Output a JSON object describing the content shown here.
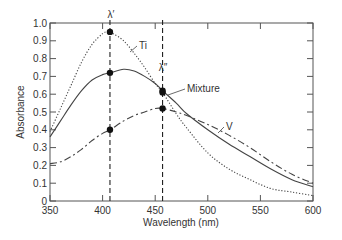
{
  "chart_data": {
    "type": "line",
    "title": "",
    "xlabel": "Wavelength (nm)",
    "ylabel": "Absorbance",
    "xlim": [
      350,
      600
    ],
    "ylim": [
      0,
      1.0
    ],
    "xticks": [
      350,
      400,
      450,
      500,
      550,
      600
    ],
    "xtick_labels": [
      "350",
      "400",
      "450",
      "500",
      "550",
      "600"
    ],
    "yticks": [
      0,
      0.1,
      0.2,
      0.3,
      0.4,
      0.5,
      0.6,
      0.7,
      0.8,
      0.9,
      1.0
    ],
    "ytick_labels": [
      "0",
      "0.1",
      "0.2",
      "0.3",
      "0.4",
      "0.5",
      "0.6",
      "0.7",
      "0.8",
      "0.9",
      "1.0"
    ],
    "grid": false,
    "legend": "inline labels",
    "series": [
      {
        "name": "Ti",
        "style": "dotted",
        "x": [
          350,
          360,
          370,
          380,
          390,
          400,
          405,
          410,
          420,
          430,
          440,
          450,
          457,
          470,
          480,
          500,
          520,
          540,
          560,
          580,
          600
        ],
        "values": [
          0.39,
          0.52,
          0.65,
          0.78,
          0.88,
          0.94,
          0.95,
          0.94,
          0.9,
          0.83,
          0.75,
          0.66,
          0.61,
          0.49,
          0.41,
          0.27,
          0.18,
          0.12,
          0.07,
          0.05,
          0.03
        ]
      },
      {
        "name": "Mixture",
        "style": "solid",
        "x": [
          350,
          360,
          370,
          380,
          390,
          400,
          407,
          420,
          430,
          440,
          450,
          457,
          470,
          480,
          500,
          520,
          540,
          560,
          580,
          600
        ],
        "values": [
          0.36,
          0.45,
          0.54,
          0.62,
          0.68,
          0.71,
          0.72,
          0.74,
          0.73,
          0.7,
          0.66,
          0.62,
          0.55,
          0.49,
          0.4,
          0.32,
          0.25,
          0.18,
          0.12,
          0.08
        ]
      },
      {
        "name": "V",
        "style": "dash-dot",
        "x": [
          350,
          360,
          370,
          380,
          390,
          400,
          407,
          420,
          430,
          440,
          450,
          457,
          470,
          480,
          500,
          520,
          540,
          560,
          580,
          600
        ],
        "values": [
          0.21,
          0.22,
          0.25,
          0.29,
          0.34,
          0.38,
          0.4,
          0.45,
          0.48,
          0.5,
          0.52,
          0.52,
          0.5,
          0.48,
          0.43,
          0.37,
          0.3,
          0.22,
          0.15,
          0.1
        ]
      }
    ],
    "markers": [
      {
        "x": 407,
        "y": 0.95,
        "series": "Ti"
      },
      {
        "x": 407,
        "y": 0.72,
        "series": "Mixture"
      },
      {
        "x": 407,
        "y": 0.4,
        "series": "V"
      },
      {
        "x": 457,
        "y": 0.62,
        "series": "Mixture"
      },
      {
        "x": 457,
        "y": 0.61,
        "series": "Ti"
      },
      {
        "x": 457,
        "y": 0.52,
        "series": "V"
      }
    ],
    "vertical_lines": [
      {
        "x": 407,
        "label": "λ′"
      },
      {
        "x": 457,
        "label": "λ″"
      }
    ],
    "annotations": [
      {
        "text": "Ti",
        "x": 432,
        "y": 0.9
      },
      {
        "text": "Mixture",
        "x": 480,
        "y": 0.63
      },
      {
        "text": "V",
        "x": 525,
        "y": 0.45
      }
    ]
  },
  "labels": {
    "lambda1": "λ′",
    "lambda2": "λ″",
    "ti": "Ti",
    "mixture": "Mixture",
    "v": "V",
    "xlabel": "Wavelength (nm)",
    "ylabel": "Absorbance"
  },
  "colors": {
    "axis": "#555555",
    "line": "#444444",
    "marker": "#111111"
  }
}
